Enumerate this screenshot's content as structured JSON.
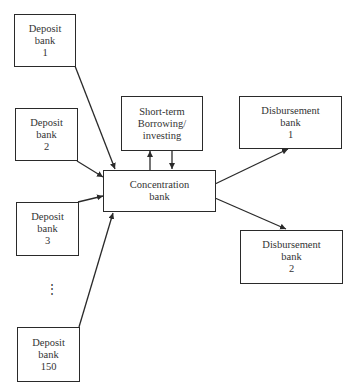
{
  "diagram": {
    "deposit_banks": [
      {
        "line1": "Deposit",
        "line2": "bank",
        "line3": "1"
      },
      {
        "line1": "Deposit",
        "line2": "bank",
        "line3": "2"
      },
      {
        "line1": "Deposit",
        "line2": "bank",
        "line3": "3"
      },
      {
        "line1": "Deposit",
        "line2": "bank",
        "line3": "150"
      }
    ],
    "ellipsis": "⋮",
    "short_term": {
      "line1": "Short-term",
      "line2": "Borrowing/",
      "line3": "investing"
    },
    "concentration": {
      "line1": "Concentration",
      "line2": "bank"
    },
    "disbursement_banks": [
      {
        "line1": "Disbursement",
        "line2": "bank",
        "line3": "1"
      },
      {
        "line1": "Disbursement",
        "line2": "bank",
        "line3": "2"
      }
    ],
    "colors": {
      "line": "#2a2a2a",
      "text": "#333333",
      "background": "#ffffff"
    }
  }
}
